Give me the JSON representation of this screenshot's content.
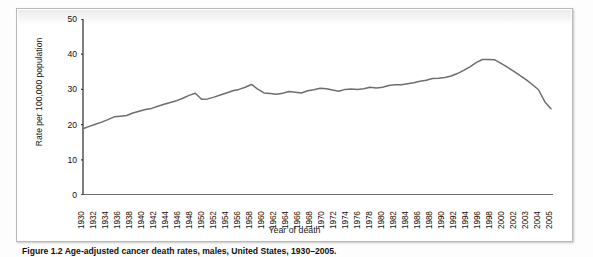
{
  "figure": {
    "caption": "Figure 1.2  Age-adjusted cancer death rates, males, United States, 1930–2005.",
    "xlabel": "Year of death",
    "ylabel": "Rate per 100,000 population"
  },
  "chart_data": {
    "type": "line",
    "title": "",
    "xlabel": "Year of death",
    "ylabel": "Rate per 100,000 population",
    "ylim": [
      0,
      50
    ],
    "yticks": [
      0,
      10,
      20,
      30,
      40,
      50
    ],
    "grid": false,
    "legend": null,
    "line_color": "#6e6e6e",
    "tick_labels": [
      "1930",
      "1932",
      "1934",
      "1936",
      "1938",
      "1940",
      "1942",
      "1944",
      "1946",
      "1948",
      "1950",
      "1952",
      "1954",
      "1956",
      "1958",
      "1960",
      "1962",
      "1964",
      "1966",
      "1968",
      "1970",
      "1972",
      "1974",
      "1976",
      "1978",
      "1980",
      "1982",
      "1984",
      "1986",
      "1988",
      "1990",
      "1992",
      "1994",
      "1996",
      "1998",
      "2000",
      "2002",
      "2003",
      "2004",
      "2005"
    ],
    "x": [
      1930,
      1931,
      1932,
      1933,
      1934,
      1935,
      1936,
      1937,
      1938,
      1939,
      1940,
      1941,
      1942,
      1943,
      1944,
      1945,
      1946,
      1947,
      1948,
      1949,
      1950,
      1951,
      1952,
      1953,
      1954,
      1955,
      1956,
      1957,
      1958,
      1959,
      1960,
      1961,
      1962,
      1963,
      1964,
      1965,
      1966,
      1967,
      1968,
      1969,
      1970,
      1971,
      1972,
      1973,
      1974,
      1975,
      1976,
      1977,
      1978,
      1979,
      1980,
      1981,
      1982,
      1983,
      1984,
      1985,
      1986,
      1987,
      1988,
      1989,
      1990,
      1991,
      1992,
      1993,
      1994,
      1995,
      1996,
      1997,
      1998,
      1999,
      2000,
      2001,
      2002,
      2003,
      2004,
      2005
    ],
    "values": [
      18.8,
      19.5,
      20.1,
      20.7,
      21.4,
      22.2,
      22.4,
      22.6,
      23.3,
      23.8,
      24.3,
      24.6,
      25.2,
      25.8,
      26.3,
      26.8,
      27.5,
      28.3,
      28.9,
      27.2,
      27.3,
      27.8,
      28.4,
      29.0,
      29.6,
      30.0,
      30.6,
      31.4,
      30.1,
      29.0,
      28.8,
      28.6,
      28.9,
      29.4,
      29.2,
      29.0,
      29.6,
      29.9,
      30.3,
      30.2,
      29.8,
      29.5,
      30.0,
      30.1,
      30.0,
      30.2,
      30.6,
      30.4,
      30.6,
      31.1,
      31.3,
      31.3,
      31.6,
      31.9,
      32.3,
      32.6,
      33.1,
      33.2,
      33.4,
      33.8,
      34.5,
      35.4,
      36.4,
      37.6,
      38.5,
      38.5,
      38.4,
      37.4,
      36.3,
      35.2,
      34.0,
      32.8,
      31.4,
      29.9,
      26.5,
      24.5
    ],
    "x_range": [
      1930,
      2005
    ],
    "peak": {
      "year": 1994,
      "value": 38.5
    },
    "start": {
      "year": 1930,
      "value": 18.8
    },
    "end": {
      "year": 2005,
      "value": 24.5
    }
  }
}
